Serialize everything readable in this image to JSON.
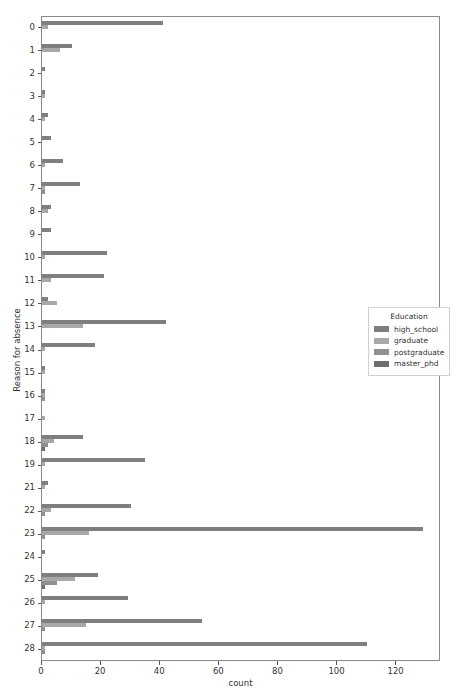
{
  "chart_data": {
    "type": "bar",
    "orientation": "horizontal",
    "title": "",
    "xlabel": "count",
    "ylabel": "Reason for absence",
    "xlim": [
      0,
      135
    ],
    "ylim_categories": 28,
    "grid": false,
    "legend_position": "center right",
    "legend_title": "Education",
    "xticks": [
      0,
      20,
      40,
      60,
      80,
      100,
      120
    ],
    "categories": [
      "0",
      "1",
      "2",
      "3",
      "4",
      "5",
      "6",
      "7",
      "8",
      "9",
      "10",
      "11",
      "12",
      "13",
      "14",
      "15",
      "16",
      "17",
      "18",
      "19",
      "21",
      "22",
      "23",
      "24",
      "25",
      "26",
      "27",
      "28"
    ],
    "series": [
      {
        "name": "high_school",
        "color": "#7f7f7f",
        "values": [
          41,
          10,
          1,
          1,
          2,
          3,
          7,
          13,
          3,
          3,
          22,
          21,
          2,
          42,
          18,
          1,
          1,
          0,
          14,
          35,
          2,
          30,
          129,
          1,
          19,
          29,
          54,
          110
        ]
      },
      {
        "name": "graduate",
        "color": "#a8a8a8",
        "values": [
          2,
          6,
          0,
          1,
          1,
          0,
          1,
          1,
          2,
          0,
          1,
          3,
          5,
          14,
          1,
          1,
          1,
          1,
          4,
          1,
          1,
          3,
          16,
          0,
          11,
          1,
          15,
          1
        ]
      },
      {
        "name": "postgraduate",
        "color": "#909090",
        "values": [
          0,
          0,
          0,
          0,
          0,
          0,
          0,
          1,
          0,
          0,
          0,
          0,
          0,
          0,
          0,
          0,
          1,
          0,
          2,
          0,
          0,
          1,
          1,
          0,
          5,
          0,
          1,
          1
        ]
      },
      {
        "name": "master_phd",
        "color": "#6e6e6e",
        "values": [
          0,
          0,
          0,
          0,
          0,
          0,
          0,
          0,
          0,
          0,
          0,
          0,
          0,
          0,
          0,
          0,
          0,
          0,
          1,
          0,
          0,
          0,
          0,
          0,
          1,
          0,
          0,
          0
        ]
      }
    ]
  }
}
